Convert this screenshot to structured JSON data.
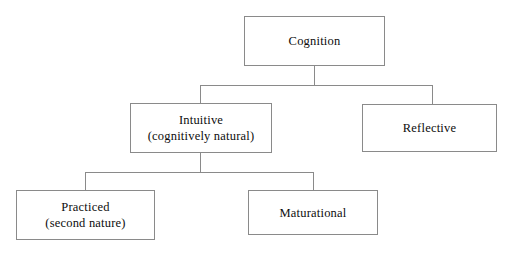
{
  "diagram": {
    "type": "hierarchy-tree",
    "background_color": "#ffffff",
    "border_color": "#8a8a8a",
    "text_color": "#0d0d0d",
    "nodes": {
      "cognition": {
        "label": "Cognition"
      },
      "intuitive": {
        "label": "Intuitive",
        "label_line2": "(cognitively natural)"
      },
      "reflective": {
        "label": "Reflective"
      },
      "practiced": {
        "label": "Practiced",
        "label_line2": "(second nature)"
      },
      "maturational": {
        "label": "Maturational"
      }
    }
  }
}
